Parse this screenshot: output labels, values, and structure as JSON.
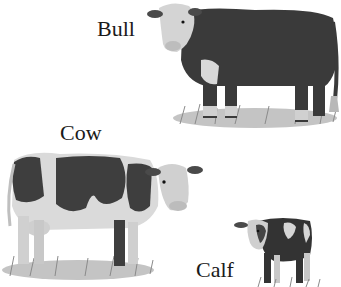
{
  "labels": {
    "bull": "Bull",
    "cow": "Cow",
    "calf": "Calf"
  },
  "colors": {
    "background": "#ffffff",
    "dark_coat": "#3a3a3a",
    "light_coat": "#d8d8d8",
    "grass": "#9a9a9a",
    "text": "#1a1a1a"
  }
}
